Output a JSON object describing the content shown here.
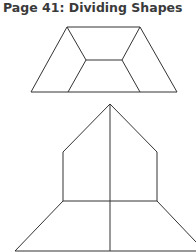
{
  "page": {
    "title": "Page 41: Dividing Shapes"
  },
  "figures": [
    {
      "name": "trapezoid-divided-into-hexagon-parts",
      "description": "Trapezoid divided into four pieces by an inner hexagonal path"
    },
    {
      "name": "house-over-trapezoid",
      "description": "Pentagon house shape over trapezoid, halved by a vertical line"
    }
  ],
  "colors": {
    "line": "#333333",
    "text": "#3a3a3a",
    "background": "#ffffff"
  }
}
